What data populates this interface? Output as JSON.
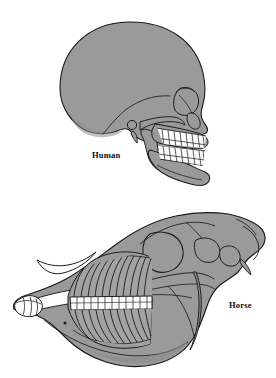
{
  "figure": {
    "background_color": "#ffffff",
    "outline_color": "#1a1a1a",
    "bone_fill_color": "#9a9a9a",
    "bone_shade_color": "#8c8c8c",
    "tooth_fill_color": "#fcfcfc",
    "width": 276,
    "height": 378
  },
  "specimens": [
    {
      "id": "human",
      "label": "Human",
      "label_x": 92,
      "label_y": 151,
      "view": "lateral",
      "dentition": "brachydont",
      "tooth_rows": 2,
      "upper_teeth_count": 8,
      "lower_teeth_count": 8
    },
    {
      "id": "horse",
      "label": "Horse",
      "label_x": 229,
      "label_y": 301,
      "view": "lateral",
      "dentition": "hypsodont",
      "tooth_rows": 2,
      "upper_teeth_count": 12,
      "lower_teeth_count": 12,
      "incisor_count": 3
    }
  ]
}
